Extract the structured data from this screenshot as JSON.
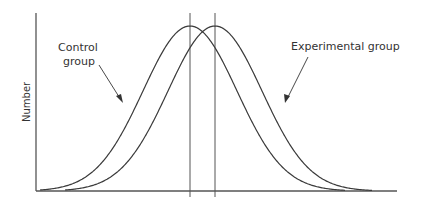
{
  "chart_data": {
    "type": "line",
    "title": "",
    "xlabel": "",
    "ylabel": "Number",
    "grid": false,
    "legend": "none (direct labels with arrows)",
    "series": [
      {
        "name": "Control group",
        "shape": "normal distribution curve",
        "mean_relative": 0.0,
        "peak_relative_height": 1.0,
        "mean_marker": "vertical line through peak"
      },
      {
        "name": "Experimental group",
        "shape": "normal distribution curve",
        "mean_relative": 0.5,
        "peak_relative_height": 1.0,
        "mean_marker": "vertical line through peak"
      }
    ],
    "annotations": [
      {
        "text": "Control group",
        "points_to": "Control group curve (left rising flank)"
      },
      {
        "text": "Experimental group",
        "points_to": "Experimental group curve (right falling flank)"
      }
    ]
  },
  "labels": {
    "y_axis": "Number",
    "control_line1": "Control",
    "control_line2": "group",
    "experimental": "Experimental group"
  },
  "colors": {
    "line": "#3a3a3a",
    "axis": "#555555",
    "text": "#333333",
    "background": "#ffffff"
  }
}
